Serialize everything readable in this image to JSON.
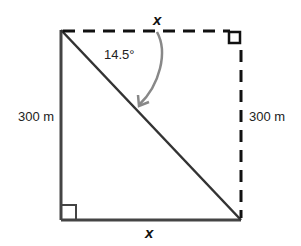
{
  "diagram": {
    "type": "right-triangle geometry",
    "labels": {
      "top_side": "x",
      "bottom_side": "x",
      "left_side": "300 m",
      "right_side": "300 m",
      "angle": "14.5°"
    },
    "colors": {
      "solid_line": "#444444",
      "dashed_line": "#111111",
      "arc": "#888888"
    }
  }
}
